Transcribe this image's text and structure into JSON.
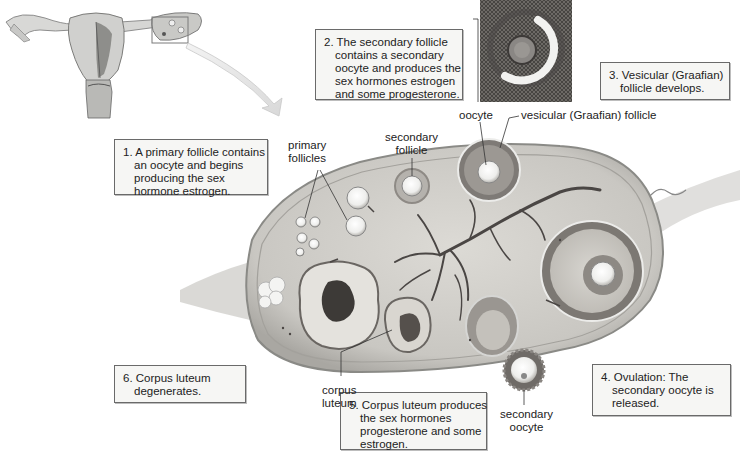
{
  "steps": [
    {
      "number": "1.",
      "lines": [
        "A primary follicle contains",
        "an oocyte and begins",
        "producing the sex",
        "hormone estrogen."
      ]
    },
    {
      "number": "2.",
      "lines": [
        "The secondary follicle",
        "contains a secondary",
        "oocyte and produces the",
        "sex hormones estrogen",
        "and some progesterone."
      ]
    },
    {
      "number": "3.",
      "lines": [
        "Vesicular (Graafian)",
        "follicle develops."
      ]
    },
    {
      "number": "4.",
      "lines": [
        "Ovulation: The",
        "secondary oocyte is",
        "released."
      ]
    },
    {
      "number": "5.",
      "lines": [
        "Corpus luteum produces",
        "the sex hormones",
        "progesterone and some",
        "estrogen."
      ]
    },
    {
      "number": "6.",
      "lines": [
        "Corpus luteum",
        "degenerates."
      ]
    }
  ],
  "labels": {
    "primary_follicles": [
      "primary",
      "follicles"
    ],
    "secondary_follicle": [
      "secondary",
      "follicle"
    ],
    "oocyte": [
      "oocyte"
    ],
    "vesicular_follicle": [
      "vesicular (Graafian) follicle"
    ],
    "corpus_luteum": [
      "corpus",
      "luteum"
    ],
    "secondary_oocyte": [
      "secondary",
      "oocyte"
    ]
  },
  "colors": {
    "box_bg": "#f6f6f4",
    "box_border": "#6a6a6a",
    "ovary_fill": "#cfcdc8",
    "ovary_edge": "#8a8a86",
    "vessel": "#4a4644"
  }
}
